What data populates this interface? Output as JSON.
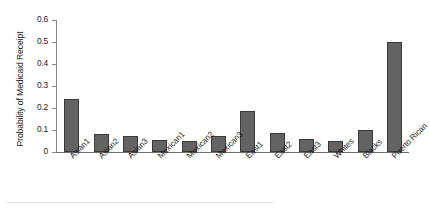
{
  "chart_data": {
    "type": "bar",
    "title": "",
    "xlabel": "",
    "ylabel": "Probability of Medicaid Receipt",
    "categories": [
      "Asian1",
      "Asian2",
      "Asian3",
      "Mexican1",
      "Mexican2",
      "Mexican3",
      "East1",
      "East2",
      "East3",
      "Whites",
      "Blacks",
      "Puerto Rican"
    ],
    "values": [
      0.24,
      0.08,
      0.072,
      0.055,
      0.05,
      0.075,
      0.185,
      0.085,
      0.06,
      0.05,
      0.1,
      0.5
    ],
    "ylim": [
      0,
      0.6
    ],
    "yticks": [
      "0",
      "0.1",
      "0.2",
      "0.3",
      "0.4",
      "0.5",
      "0.6"
    ],
    "ytick_values": [
      0,
      0.1,
      0.2,
      0.3,
      0.4,
      0.5,
      0.6
    ],
    "grid": false,
    "legend": "none",
    "bar_color": "#636363",
    "bar_edge_color": "#3a3a3a",
    "axis_color": "#8a8a8a"
  }
}
